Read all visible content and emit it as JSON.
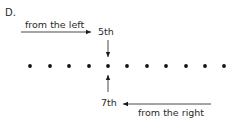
{
  "label": "D.",
  "left_annotation": {
    "text": "from the left",
    "ordinal": "5th"
  },
  "right_annotation": {
    "text": "from the right",
    "ordinal": "7th"
  },
  "dots": {
    "count": 11,
    "highlighted_index_from_left": 5,
    "highlighted_index_from_right": 7
  },
  "colors": {
    "ink": "#1a1a1a",
    "text": "#2a2a2a",
    "background": "#ffffff"
  }
}
